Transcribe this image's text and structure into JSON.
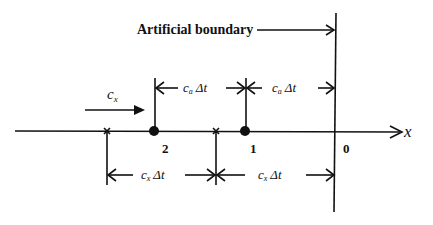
{
  "diagram": {
    "boundary_label": "Artificial boundary",
    "axis_label": "x",
    "velocity_label": "c",
    "velocity_sub": "x",
    "top_interval_label": "c",
    "top_interval_sub": "a",
    "bottom_interval_label": "c",
    "bottom_interval_sub": "x",
    "dt_label": "Δt",
    "points": [
      {
        "label": "2",
        "kind": "node"
      },
      {
        "label": "1",
        "kind": "node"
      },
      {
        "label": "0",
        "kind": "boundary"
      }
    ],
    "colors": {
      "ink": "#111111",
      "background": "#ffffff"
    }
  }
}
